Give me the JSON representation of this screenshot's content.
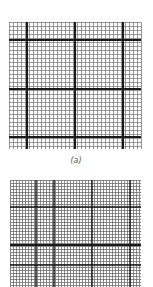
{
  "figure": {
    "panels": [
      {
        "id": "a",
        "caption": "(a)",
        "description": "graph paper grid with fine lines and heavy major lines",
        "box": {
          "x": 9,
          "y": 22,
          "w": 132,
          "h": 127
        },
        "minor_spacing": 4,
        "major_v": [
          27,
          75,
          123
        ],
        "major_h": [
          40,
          89,
          137
        ],
        "minor_color": "#8a8a8a",
        "major_color": "#1a1a1a"
      },
      {
        "id": "b",
        "caption": "",
        "description": "finer graph paper grid with medium and heavy lines",
        "box": {
          "x": 10,
          "y": 180,
          "w": 131,
          "h": 107
        },
        "minor_spacing": 3,
        "medium_v": [
          36,
          54,
          92,
          130
        ],
        "medium_h": [
          207,
          265
        ],
        "major_h": [
          245
        ],
        "minor_color": "#7a7a7a",
        "major_color": "#1a1a1a"
      }
    ]
  }
}
